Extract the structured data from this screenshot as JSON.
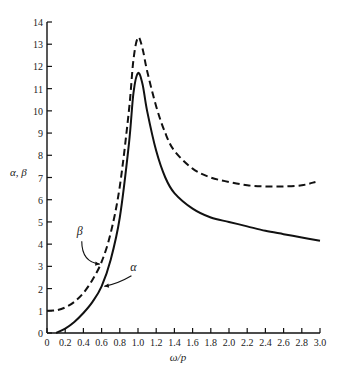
{
  "chart_data": {
    "type": "line",
    "title": "",
    "xlabel": "ω/p",
    "ylabel": "α, β",
    "xlim": [
      0,
      3.0
    ],
    "ylim": [
      0,
      14
    ],
    "grid": false,
    "x_ticks": [
      "0",
      "0.2",
      "0.4",
      "0.6",
      "0.8",
      "1.0",
      "1.2",
      "1.4",
      "1.6",
      "1.8",
      "2.0",
      "2.2",
      "2.4",
      "2.6",
      "2.8",
      "3.0"
    ],
    "y_ticks": [
      "0",
      "1",
      "2",
      "3",
      "4",
      "5",
      "6",
      "7",
      "8",
      "9",
      "10",
      "11",
      "12",
      "13",
      "14"
    ],
    "series": [
      {
        "name": "β",
        "style": "dashed",
        "x": [
          0,
          0.1,
          0.2,
          0.3,
          0.4,
          0.5,
          0.6,
          0.7,
          0.8,
          0.9,
          0.95,
          1.0,
          1.05,
          1.1,
          1.2,
          1.3,
          1.4,
          1.6,
          1.8,
          2.0,
          2.2,
          2.4,
          2.6,
          2.8,
          2.95
        ],
        "y": [
          1.0,
          1.02,
          1.15,
          1.4,
          1.8,
          2.4,
          3.2,
          4.5,
          6.6,
          10.0,
          12.3,
          13.3,
          12.8,
          11.8,
          10.2,
          9.0,
          8.2,
          7.4,
          7.0,
          6.8,
          6.65,
          6.6,
          6.6,
          6.65,
          6.8
        ]
      },
      {
        "name": "α",
        "style": "solid",
        "x": [
          0.1,
          0.2,
          0.3,
          0.4,
          0.5,
          0.6,
          0.7,
          0.8,
          0.9,
          0.95,
          1.0,
          1.05,
          1.1,
          1.2,
          1.3,
          1.4,
          1.6,
          1.8,
          2.0,
          2.2,
          2.4,
          2.6,
          2.8,
          3.0
        ],
        "y": [
          0.0,
          0.2,
          0.5,
          0.9,
          1.4,
          2.1,
          3.3,
          5.2,
          8.5,
          10.8,
          11.7,
          11.2,
          10.0,
          8.2,
          7.0,
          6.3,
          5.6,
          5.2,
          5.0,
          4.8,
          4.6,
          4.45,
          4.3,
          4.15
        ]
      }
    ],
    "annotations": [
      {
        "text": "β",
        "x": 0.36,
        "y": 4.4,
        "arrow_to": [
          0.58,
          3.1
        ]
      },
      {
        "text": "α",
        "x": 0.95,
        "y": 2.8,
        "arrow_to": [
          0.63,
          2.1
        ]
      }
    ]
  }
}
